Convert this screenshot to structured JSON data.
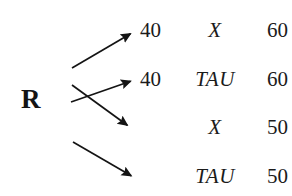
{
  "figure": {
    "background_color": "#ffffff",
    "ink_color": "#1b1b1b",
    "source_node": {
      "label": "R",
      "name": "node-r"
    },
    "rows": [
      {
        "value_left": "40",
        "symbol": "X",
        "value_right": "60"
      },
      {
        "value_left": "40",
        "symbol": "TAU",
        "value_right": "60"
      },
      {
        "value_left": "",
        "symbol": "X",
        "value_right": "50"
      },
      {
        "value_left": "",
        "symbol": "TAU",
        "value_right": "50"
      }
    ],
    "arrows": [
      {
        "name": "arrow-to-row-1",
        "from_x": 72,
        "from_y": 68,
        "to_x": 134,
        "to_y": 32,
        "direction": "up-right"
      },
      {
        "name": "arrow-to-row-2",
        "from_x": 71,
        "from_y": 102,
        "to_x": 134,
        "to_y": 80,
        "direction": "up-right"
      },
      {
        "name": "arrow-to-row-3",
        "from_x": 72,
        "from_y": 85,
        "to_x": 131,
        "to_y": 128,
        "direction": "down-right"
      },
      {
        "name": "arrow-to-row-4",
        "from_x": 73,
        "from_y": 142,
        "to_x": 135,
        "to_y": 178,
        "direction": "down-right"
      }
    ]
  }
}
